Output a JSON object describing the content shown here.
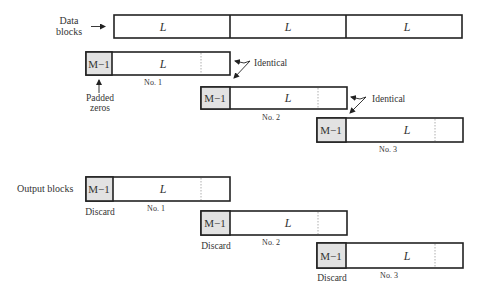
{
  "diagram": {
    "data_blocks": {
      "label_line1": "Data",
      "label_line2": "blocks",
      "segments": [
        "L",
        "L",
        "L"
      ]
    },
    "input_blocks": [
      {
        "pad_label": "M−1",
        "body_label": "L",
        "caption": "No. 1"
      },
      {
        "pad_label": "M−1",
        "body_label": "L",
        "caption": "No. 2"
      },
      {
        "pad_label": "M−1",
        "body_label": "L",
        "caption": "No. 3"
      }
    ],
    "annotations": {
      "padded_line1": "Padded",
      "padded_line2": "zeros",
      "identical_1": "Identical",
      "identical_2": "Identical"
    },
    "output_blocks": {
      "label": "Output blocks",
      "blocks": [
        {
          "pad_label": "M−1",
          "body_label": "L",
          "caption": "No. 1",
          "discard_label": "Discard"
        },
        {
          "pad_label": "M−1",
          "body_label": "L",
          "caption": "No. 2",
          "discard_label": "Discard"
        },
        {
          "pad_label": "M−1",
          "body_label": "L",
          "caption": "No. 3",
          "discard_label": "Discard"
        }
      ]
    },
    "colors": {
      "pad_fill": "#e2e2e2",
      "stroke": "#222222"
    }
  }
}
